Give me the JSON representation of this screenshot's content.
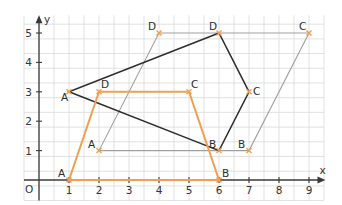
{
  "axes": {
    "x_label": "x",
    "y_label": "y",
    "origin_label": "O",
    "x_ticks": [
      "1",
      "2",
      "3",
      "4",
      "5",
      "6",
      "7",
      "8",
      "9"
    ],
    "y_ticks": [
      "1",
      "2",
      "3",
      "4",
      "5"
    ],
    "x_range": [
      -0.5,
      9.5
    ],
    "y_range": [
      -0.7,
      5.6
    ],
    "grid_step": 0.5
  },
  "colors": {
    "grid": "#d9d9d9",
    "axis": "#3a3a3a",
    "black_shape": "#2d2d2d",
    "orange_shape": "#f0a050",
    "gray_shape": "#a0a0a0",
    "point_marker": "#f0a050"
  },
  "shapes": [
    {
      "name": "black-quadrilateral",
      "color": "#2d2d2d",
      "width": 1.5,
      "points": [
        {
          "label": "A",
          "x": 1,
          "y": 3,
          "lx": -8,
          "ly": 9
        },
        {
          "label": "B",
          "x": 6,
          "y": 1,
          "lx": -10,
          "ly": -3
        },
        {
          "label": "C",
          "x": 7,
          "y": 3,
          "lx": 4,
          "ly": 3
        },
        {
          "label": "D",
          "x": 6,
          "y": 5,
          "lx": -10,
          "ly": -3
        }
      ]
    },
    {
      "name": "orange-trapezoid",
      "color": "#f0a050",
      "width": 2,
      "points": [
        {
          "label": "A",
          "x": 1,
          "y": 0,
          "lx": -11,
          "ly": -3
        },
        {
          "label": "B",
          "x": 6,
          "y": 0,
          "lx": 3,
          "ly": -3
        },
        {
          "label": "C",
          "x": 5,
          "y": 3,
          "lx": 2,
          "ly": -4
        },
        {
          "label": "D",
          "x": 2,
          "y": 3,
          "lx": 2,
          "ly": -4
        }
      ]
    },
    {
      "name": "gray-parallelogram",
      "color": "#a0a0a0",
      "width": 1.1,
      "points": [
        {
          "label": "A",
          "x": 2,
          "y": 1,
          "lx": -11,
          "ly": -3
        },
        {
          "label": "B",
          "x": 7,
          "y": 1,
          "lx": -11,
          "ly": -3
        },
        {
          "label": "C",
          "x": 9,
          "y": 5,
          "lx": -10,
          "ly": -3
        },
        {
          "label": "D",
          "x": 4,
          "y": 5,
          "lx": -11,
          "ly": -3
        }
      ]
    }
  ]
}
